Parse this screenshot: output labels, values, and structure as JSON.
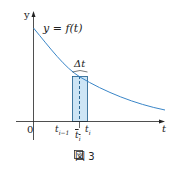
{
  "figure": {
    "caption": "図 3",
    "curve_label": "y = f(t)",
    "y_axis_label": "y",
    "x_axis_label": "t",
    "origin_label": "0",
    "delta_label": "Δt",
    "tick_left": "t",
    "tick_left_sub": "i−1",
    "tick_right": "t",
    "tick_right_sub": "i",
    "sample_label": "t",
    "sample_sub": "i",
    "colors": {
      "curve": "#3a86c8",
      "rect_fill": "#cde5f5",
      "rect_stroke": "#1a5a8a",
      "axis": "#222222"
    }
  }
}
